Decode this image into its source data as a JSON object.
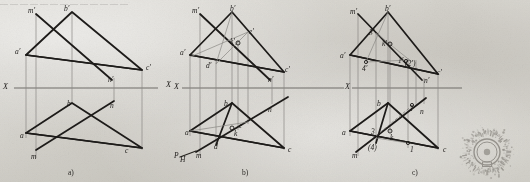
{
  "page": {
    "width": 530,
    "height": 182,
    "background_color": "#d9d7d1",
    "ink_color": "#1d1b19",
    "axis_color": "#6f6d69",
    "thin_color": "#8c8a86"
  },
  "top_cut_text": "— —  —   —  —    —  —   —     —   —  —    — —",
  "captions": [
    {
      "id": "caption-a",
      "text": "a)",
      "x": 68,
      "y": 168
    },
    {
      "id": "caption-b",
      "text": "b)",
      "x": 242,
      "y": 168
    },
    {
      "id": "caption-c",
      "text": "c)",
      "x": 412,
      "y": 168
    }
  ],
  "axis_labels": [
    {
      "id": "axis-x-left-a",
      "text": "X",
      "x": 3,
      "y": 83
    },
    {
      "id": "axis-x-right-a",
      "text": "X",
      "x": 166,
      "y": 81
    },
    {
      "id": "axis-x-left-b",
      "text": "X",
      "x": 174,
      "y": 83
    },
    {
      "id": "axis-x-left-c",
      "text": "X",
      "x": 345,
      "y": 83
    }
  ],
  "diagrams": [
    {
      "id": "diagram-a",
      "caption": "a)",
      "axis_y": 88,
      "axis_x1": 10,
      "axis_x2": 160,
      "labels": [
        {
          "text": "m′",
          "x": 28,
          "y": 7
        },
        {
          "text": "b′",
          "x": 64,
          "y": 5
        },
        {
          "text": "a′",
          "x": 15,
          "y": 48
        },
        {
          "text": "c′",
          "x": 146,
          "y": 64
        },
        {
          "text": "n′",
          "x": 108,
          "y": 76
        },
        {
          "text": "b",
          "x": 67,
          "y": 100
        },
        {
          "text": "n",
          "x": 110,
          "y": 102
        },
        {
          "text": "a",
          "x": 20,
          "y": 132
        },
        {
          "text": "m",
          "x": 31,
          "y": 153
        },
        {
          "text": "c",
          "x": 125,
          "y": 147
        }
      ]
    },
    {
      "id": "diagram-b",
      "caption": "b)",
      "axis_y": 88,
      "axis_x1": 178,
      "axis_x2": 340,
      "labels": [
        {
          "text": "m′",
          "x": 192,
          "y": 7
        },
        {
          "text": "b′",
          "x": 230,
          "y": 5
        },
        {
          "text": "e′",
          "x": 249,
          "y": 28
        },
        {
          "text": "k′",
          "x": 230,
          "y": 38
        },
        {
          "text": "a′",
          "x": 180,
          "y": 49
        },
        {
          "text": "d′",
          "x": 206,
          "y": 62
        },
        {
          "text": "n′",
          "x": 268,
          "y": 76
        },
        {
          "text": "c′",
          "x": 285,
          "y": 66
        },
        {
          "text": "b",
          "x": 224,
          "y": 100
        },
        {
          "text": "n",
          "x": 268,
          "y": 106
        },
        {
          "text": "e",
          "x": 239,
          "y": 122
        },
        {
          "text": "a",
          "x": 185,
          "y": 129
        },
        {
          "text": "k",
          "x": 234,
          "y": 130
        },
        {
          "text": "d",
          "x": 214,
          "y": 143
        },
        {
          "text": "m",
          "x": 196,
          "y": 152
        },
        {
          "text": "c",
          "x": 288,
          "y": 146
        },
        {
          "text": "P",
          "x": 174,
          "y": 152
        },
        {
          "text": "H",
          "x": 180,
          "y": 156
        }
      ]
    },
    {
      "id": "diagram-c",
      "caption": "c)",
      "axis_y": 88,
      "axis_x1": 348,
      "axis_x2": 465,
      "labels": [
        {
          "text": "m′",
          "x": 350,
          "y": 8
        },
        {
          "text": "b′",
          "x": 385,
          "y": 5
        },
        {
          "text": "3′",
          "x": 369,
          "y": 29
        },
        {
          "text": "k′",
          "x": 382,
          "y": 40
        },
        {
          "text": "a′",
          "x": 340,
          "y": 52
        },
        {
          "text": "1′",
          "x": 398,
          "y": 57
        },
        {
          "text": "(2′)",
          "x": 405,
          "y": 60
        },
        {
          "text": "4′",
          "x": 362,
          "y": 65
        },
        {
          "text": "n′",
          "x": 424,
          "y": 77
        },
        {
          "text": "c′",
          "x": 437,
          "y": 69
        },
        {
          "text": "b",
          "x": 377,
          "y": 100
        },
        {
          "text": "2",
          "x": 409,
          "y": 105
        },
        {
          "text": "n",
          "x": 420,
          "y": 108
        },
        {
          "text": "a",
          "x": 342,
          "y": 129
        },
        {
          "text": "3",
          "x": 371,
          "y": 128
        },
        {
          "text": "k",
          "x": 390,
          "y": 134
        },
        {
          "text": "(4)",
          "x": 368,
          "y": 144
        },
        {
          "text": "1",
          "x": 410,
          "y": 146
        },
        {
          "text": "m",
          "x": 352,
          "y": 152
        },
        {
          "text": "c",
          "x": 443,
          "y": 146
        }
      ]
    }
  ],
  "stamp": {
    "id": "ink-stamp",
    "center_x": 487,
    "center_y": 152,
    "outer_radius": 27,
    "inner_radius": 13,
    "color": "#6e6a64",
    "description": "circular ink stamp / seal watermark with radial glyph ring"
  }
}
